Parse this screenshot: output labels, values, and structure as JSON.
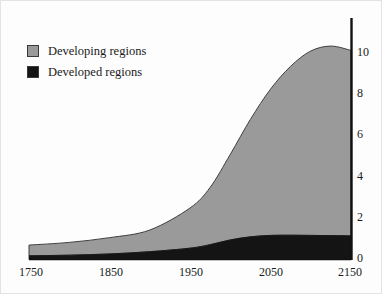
{
  "chart_data": {
    "type": "area",
    "stacked": true,
    "title": "",
    "xlabel": "",
    "ylabel": "",
    "xlim": [
      1750,
      2150
    ],
    "ylim": [
      0,
      10.6
    ],
    "xticks": [
      "1750",
      "1850",
      "1950",
      "2050",
      "2150"
    ],
    "yticks": [
      "0",
      "2",
      "4",
      "6",
      "8",
      "10"
    ],
    "grid": false,
    "legend_position": "top-left",
    "y_axis_side": "right",
    "x": [
      1750,
      1800,
      1850,
      1900,
      1950,
      1975,
      2000,
      2025,
      2050,
      2075,
      2100,
      2125,
      2150
    ],
    "series": [
      {
        "name": "Developed regions",
        "color": "#141414",
        "values": [
          0.18,
          0.21,
          0.27,
          0.38,
          0.55,
          0.72,
          0.95,
          1.1,
          1.17,
          1.18,
          1.17,
          1.16,
          1.15
        ]
      },
      {
        "name": "Developing regions",
        "color": "#9a9a9a",
        "values": [
          0.52,
          0.62,
          0.79,
          1.05,
          1.95,
          2.78,
          4.15,
          5.7,
          7.1,
          8.2,
          8.95,
          9.2,
          9.0
        ]
      }
    ],
    "totals": [
      0.7,
      0.83,
      1.06,
      1.43,
      2.5,
      3.5,
      5.1,
      6.8,
      8.27,
      9.38,
      10.12,
      10.36,
      10.15
    ]
  },
  "legend": {
    "items": [
      {
        "label": "Developing regions",
        "color": "#9a9a9a"
      },
      {
        "label": "Developed regions",
        "color": "#141414"
      }
    ]
  },
  "axes": {
    "x_tick_labels": [
      "1750",
      "1850",
      "1950",
      "2050",
      "2150"
    ],
    "y_tick_labels": [
      "10",
      "8",
      "6",
      "4",
      "2",
      "0"
    ]
  },
  "colors": {
    "developing": "#9a9a9a",
    "developed": "#141414",
    "axis": "#111111",
    "outline": "#3a3a3a",
    "frame": "#e3e3e3",
    "background": "#fdfdfd"
  }
}
